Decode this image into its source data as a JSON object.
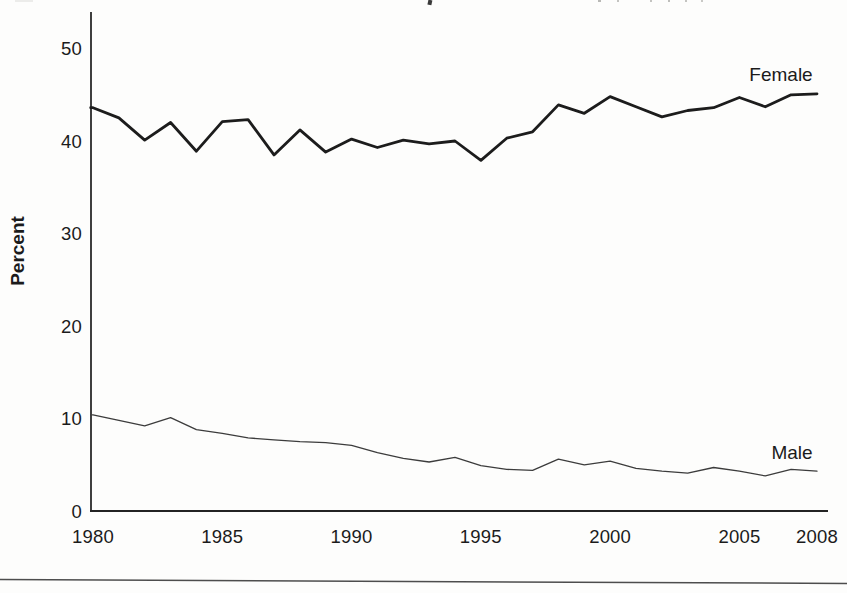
{
  "page": {
    "background_color": "#fdfdfc",
    "bottom_rule_color": "#4d4d4d"
  },
  "chart_data": {
    "type": "line",
    "ylabel": "Percent",
    "xlabel": "",
    "grid": false,
    "legend_position": "inline-labels-at-line-ends",
    "ylim": [
      0,
      54
    ],
    "xlim": [
      1980,
      2008
    ],
    "yticks": [
      0,
      10,
      20,
      30,
      40,
      50
    ],
    "xticks": [
      1980,
      1985,
      1990,
      1995,
      2000,
      2005,
      2008
    ],
    "x": [
      1980,
      1981,
      1982,
      1983,
      1984,
      1985,
      1986,
      1987,
      1988,
      1989,
      1990,
      1991,
      1992,
      1993,
      1994,
      1995,
      1996,
      1997,
      1998,
      1999,
      2000,
      2001,
      2002,
      2003,
      2004,
      2005,
      2006,
      2007,
      2008
    ],
    "series": [
      {
        "name": "Female",
        "color": "#1c1c1c",
        "stroke_width": 2.8,
        "values": [
          43.6,
          42.5,
          40.1,
          42.0,
          38.9,
          42.1,
          42.3,
          38.5,
          41.2,
          38.8,
          40.2,
          39.3,
          40.1,
          39.7,
          40.0,
          37.9,
          40.3,
          41.0,
          43.9,
          43.0,
          44.8,
          43.7,
          42.6,
          43.3,
          43.6,
          44.7,
          43.7,
          45.0,
          45.1
        ]
      },
      {
        "name": "Male",
        "color": "#3c3c3c",
        "stroke_width": 1.3,
        "values": [
          10.4,
          9.8,
          9.2,
          10.1,
          8.8,
          8.4,
          7.9,
          7.7,
          7.5,
          7.4,
          7.1,
          6.3,
          5.7,
          5.3,
          5.8,
          4.9,
          4.5,
          4.4,
          5.6,
          5.0,
          5.4,
          4.6,
          4.3,
          4.1,
          4.7,
          4.3,
          3.8,
          4.5,
          4.3
        ]
      }
    ]
  }
}
